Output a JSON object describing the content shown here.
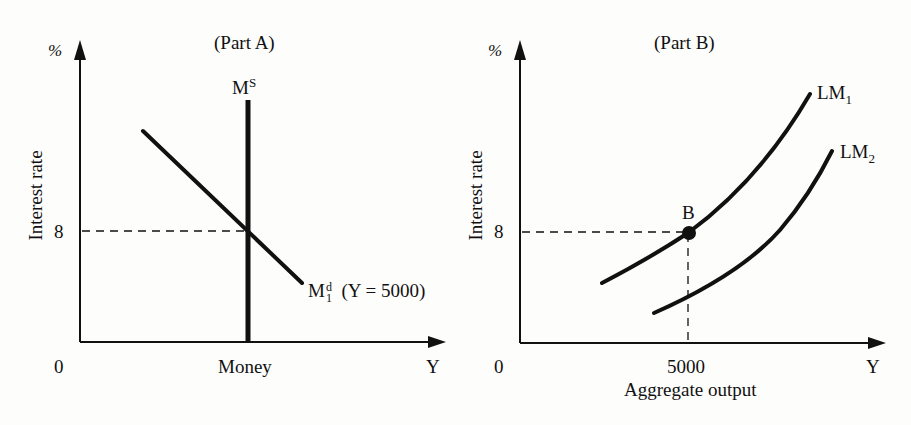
{
  "part_a": {
    "title": "(Part A)",
    "y_unit": "%",
    "y_axis_label": "Interest rate",
    "origin": "0",
    "y_tick": "8",
    "x_axis_label": "Money",
    "x_end": "Y",
    "supply_label": "M",
    "supply_sup": "S",
    "demand_label": "M",
    "demand_sup": "d",
    "demand_sub": "1",
    "demand_note": "(Y = 5000)"
  },
  "part_b": {
    "title": "(Part B)",
    "y_unit": "%",
    "y_axis_label": "Interest rate",
    "origin": "0",
    "y_tick": "8",
    "x_tick": "5000",
    "x_axis_label": "Aggregate output",
    "x_end": "Y",
    "point_label": "B",
    "lm1_label": "LM",
    "lm1_sub": "1",
    "lm2_label": "LM",
    "lm2_sub": "2"
  },
  "colors": {
    "ink": "#111111",
    "background": "#fdfdfc"
  }
}
